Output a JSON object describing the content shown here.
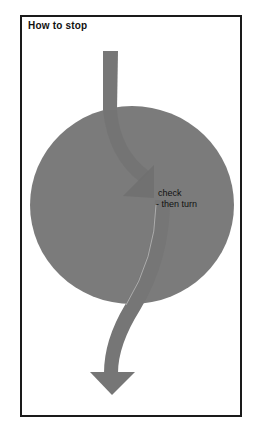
{
  "title": "How to stop",
  "annotation": {
    "line1": "check",
    "line2": "- then turn"
  },
  "colors": {
    "circle": "#7b7b7b",
    "arrow": "#747474",
    "arrow_inner": "#6f6f6f",
    "frame": "#1a1a1a",
    "background": "#ffffff"
  },
  "icons": {
    "circle": "roundabout-circle",
    "arrow": "curved-down-arrow"
  }
}
